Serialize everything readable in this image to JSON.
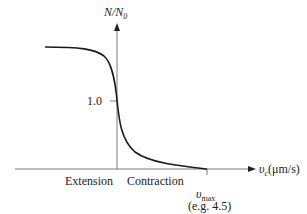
{
  "diagram": {
    "y_axis_label": "N/N",
    "y_axis_label_sub": "0",
    "x_axis_label_var": "υ",
    "x_axis_label_var_sub": "c",
    "x_axis_label_unit": "(μm/s)",
    "y_tick_label": "1.0",
    "region_left_label": "Extension",
    "region_right_label": "Contraction",
    "vmax_label": "υ",
    "vmax_label_sub": "max",
    "vmax_example": "(e.g. 4.5)",
    "colors": {
      "line": "#1a1a1a",
      "axis": "#555555",
      "background": "#ffffff"
    }
  }
}
